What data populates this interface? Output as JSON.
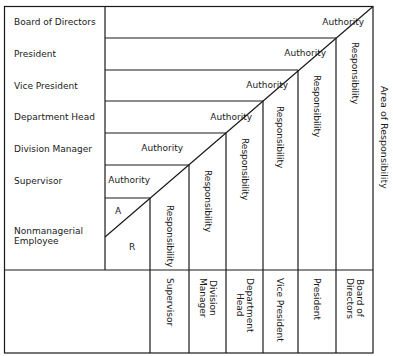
{
  "rows": [
    {
      "label": "Board of Directors",
      "y": 22
    },
    {
      "label": "President",
      "y": 54
    },
    {
      "label": "Vice President",
      "y": 86
    },
    {
      "label": "Department Head",
      "y": 117
    },
    {
      "label": "Division Manager",
      "y": 149
    },
    {
      "label": "Supervisor",
      "y": 181
    },
    {
      "label": "Nonmanagerial\nEmployee",
      "y": 236
    }
  ],
  "authority": [
    {
      "label": "Authority",
      "x": 364,
      "y": 22
    },
    {
      "label": "Authority",
      "x": 326,
      "y": 53
    },
    {
      "label": "Authority",
      "x": 288,
      "y": 85
    },
    {
      "label": "Authority",
      "x": 252,
      "y": 117
    },
    {
      "label": "Authority",
      "x": 183,
      "y": 148
    },
    {
      "label": "Authority",
      "x": 150,
      "y": 180
    }
  ],
  "responsibility": [
    {
      "label": "Responsibility",
      "x": 170,
      "y": 205
    },
    {
      "label": "Responsibility",
      "x": 208,
      "y": 170
    },
    {
      "label": "Responsibility",
      "x": 245,
      "y": 138
    },
    {
      "label": "Responsibility",
      "x": 280,
      "y": 106
    },
    {
      "label": "Responsibility",
      "x": 317,
      "y": 75
    },
    {
      "label": "Responsibility",
      "x": 355,
      "y": 42
    }
  ],
  "employee_cell": {
    "a_label": "A",
    "r_label": "R"
  },
  "columns": [
    {
      "label": "Supervisor",
      "x": 170
    },
    {
      "label": "Division\nManager",
      "x": 208
    },
    {
      "label": "Department\nHead",
      "x": 245
    },
    {
      "label": "Vice President",
      "x": 280
    },
    {
      "label": "President",
      "x": 317
    },
    {
      "label": "Board of\nDirectors",
      "x": 355
    }
  ],
  "side_label": "Area of Responsibility",
  "colors": {
    "line": "#1a1a1a",
    "background": "#ffffff"
  }
}
